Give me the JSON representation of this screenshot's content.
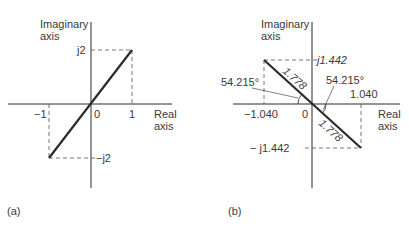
{
  "panel_a": {
    "caption": "(a)",
    "y_axis_label_line1": "Imaginary",
    "y_axis_label_line2": "axis",
    "x_axis_label_line1": "Real",
    "x_axis_label_line2": "axis",
    "origin_label": "0",
    "x_tick_pos": "1",
    "x_tick_neg": "−1",
    "y_tick_pos": "j2",
    "y_tick_neg": "−j2"
  },
  "panel_b": {
    "caption": "(b)",
    "y_axis_label_line1": "Imaginary",
    "y_axis_label_line2": "axis",
    "x_axis_label_line1": "Real",
    "x_axis_label_line2": "axis",
    "origin_label": "0",
    "x_tick_pos": "1.040",
    "x_tick_neg": "−1.040",
    "y_tick_pos": "j1.442",
    "y_tick_neg": "− j1.442",
    "magnitude_upper": "1.778",
    "magnitude_lower": "1.778",
    "angle_left": "54.215°",
    "angle_right": "54.215°"
  },
  "colors": {
    "line": "#2b2b2b",
    "text": "#3a3a3a",
    "dashed": "#555555"
  }
}
